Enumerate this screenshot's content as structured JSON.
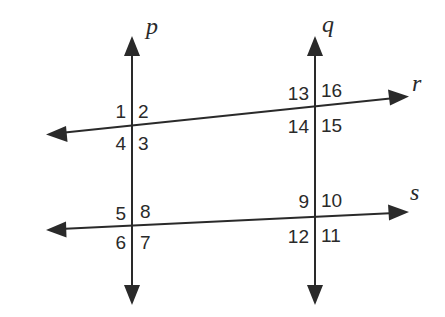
{
  "diagram": {
    "type": "two transversals crossing two lines",
    "lines": {
      "p": {
        "label": "p",
        "orientation": "vertical"
      },
      "q": {
        "label": "q",
        "orientation": "vertical"
      },
      "r": {
        "label": "r",
        "orientation": "near-horizontal"
      },
      "s": {
        "label": "s",
        "orientation": "near-horizontal"
      }
    },
    "intersections": {
      "pr": {
        "lines": "p,r",
        "angles": {
          "top_left": "1",
          "top_right": "2",
          "bottom_right": "3",
          "bottom_left": "4"
        }
      },
      "ps": {
        "lines": "p,s",
        "angles": {
          "top_left": "5",
          "top_right": "8",
          "bottom_right": "7",
          "bottom_left": "6"
        }
      },
      "qr": {
        "lines": "q,r",
        "angles": {
          "top_left": "13",
          "top_right": "16",
          "bottom_right": "15",
          "bottom_left": "14"
        }
      },
      "qs": {
        "lines": "q,s",
        "angles": {
          "top_left": "9",
          "top_right": "10",
          "bottom_right": "11",
          "bottom_left": "12"
        }
      }
    },
    "colors": {
      "ink": "#2a2a2a",
      "background": "#ffffff"
    }
  }
}
